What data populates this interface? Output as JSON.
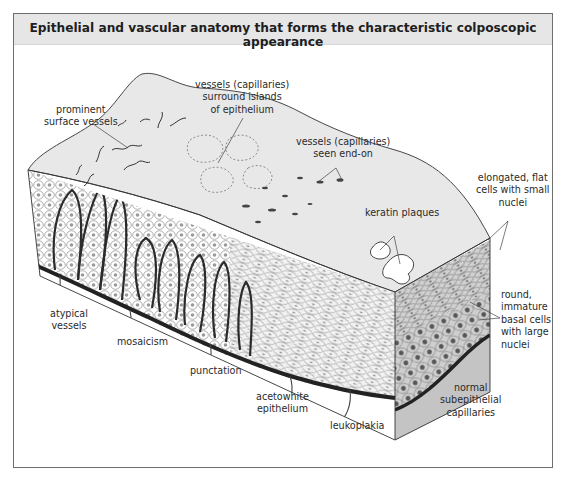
{
  "figure": {
    "title": "Epithelial and vascular anatomy that forms the characteristic colposcopic appearance",
    "colors": {
      "frame_border": "#6e6e6e",
      "title_band": "#e6e6e6",
      "surface": "#e8e8e8",
      "vessel": "#2b2b2b",
      "nucleus_light": "#9a9a9a",
      "nucleus_dark": "#555555",
      "end_face": "#c8c8c8"
    }
  },
  "labels": {
    "prominent_surface_vessels": [
      "prominent",
      "surface vessels"
    ],
    "vessels_surround_islands": [
      "vessels (capillaries)",
      "surround islands",
      "of epithelium"
    ],
    "vessels_end_on": [
      "vessels (capillaries)",
      "seen end-on"
    ],
    "keratin_plaques": [
      "keratin plaques"
    ],
    "elongated_flat_cells": [
      "elongated, flat",
      "cells with small",
      "nuclei"
    ],
    "round_basal_cells": [
      "round,",
      "immature",
      "basal cells",
      "with large",
      "nuclei"
    ],
    "atypical_vessels": [
      "atypical",
      "vessels"
    ],
    "mosaicism": [
      "mosaicism"
    ],
    "punctation": [
      "punctation"
    ],
    "acetowhite_epithelium": [
      "acetowhite",
      "epithelium"
    ],
    "leukoplakia": [
      "leukoplakia"
    ],
    "normal_subepithelial_capillaries": [
      "normal",
      "subepithelial",
      "capillaries"
    ]
  }
}
